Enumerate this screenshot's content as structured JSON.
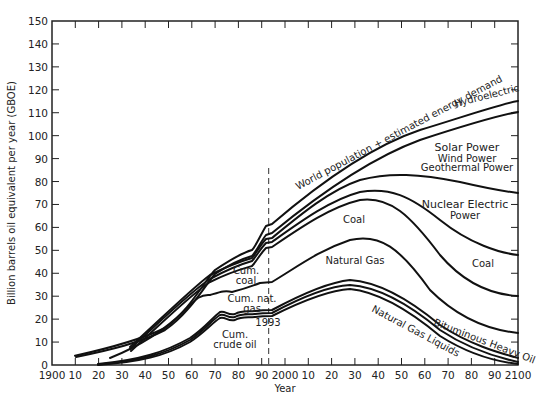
{
  "chart_data": {
    "type": "area",
    "title": "",
    "xlabel": "Year",
    "ylabel": "Billion barrels oil equivalent per year (GBOE)",
    "xlim": [
      1900,
      2100
    ],
    "ylim": [
      0,
      150
    ],
    "grid": false,
    "x_tick_labels": [
      "1900",
      "10",
      "20",
      "30",
      "40",
      "50",
      "60",
      "70",
      "80",
      "90",
      "2000",
      "10",
      "20",
      "30",
      "40",
      "50",
      "60",
      "70",
      "80",
      "90",
      "2100"
    ],
    "y_tick_labels": [
      "0",
      "10",
      "20",
      "30",
      "40",
      "50",
      "60",
      "70",
      "80",
      "90",
      "100",
      "110",
      "120",
      "130",
      "140",
      "150"
    ],
    "marker_line": {
      "year": 1993,
      "label": "1993",
      "style": "dashed"
    },
    "series": [
      {
        "name": "World population + estimated energy demand",
        "x": [
          1910,
          1930,
          1950,
          1960,
          1970,
          1980,
          1988,
          1993,
          2000,
          2020,
          2040,
          2060,
          2080,
          2100
        ],
        "values": [
          4,
          8,
          16,
          28,
          42,
          49,
          55,
          61,
          67,
          84,
          97,
          106,
          112,
          115
        ]
      },
      {
        "name": "Hydroelectric",
        "x": [
          1910,
          1930,
          1950,
          1960,
          1970,
          1980,
          1988,
          1993,
          2000,
          2020,
          2040,
          2060,
          2080,
          2100
        ],
        "values": [
          3.5,
          7,
          15,
          26,
          40,
          46,
          52,
          57,
          63,
          80,
          92,
          100,
          106,
          110
        ]
      },
      {
        "name": "Solar Power / Wind Power / Geothermal Power",
        "x": [
          1950,
          1960,
          1970,
          1980,
          1988,
          1993,
          2000,
          2020,
          2040,
          2060,
          2080,
          2100
        ],
        "values": [
          14,
          25,
          38,
          44,
          50,
          54,
          60,
          76,
          83,
          81,
          78,
          75
        ]
      },
      {
        "name": "Nuclear Electric Power",
        "x": [
          1950,
          1960,
          1970,
          1980,
          1988,
          1993,
          2000,
          2020,
          2030,
          2050,
          2070,
          2090,
          2100
        ],
        "values": [
          14,
          25,
          38,
          44,
          50,
          54,
          59,
          73,
          77,
          70,
          58,
          50,
          48
        ]
      },
      {
        "name": "Coal",
        "x": [
          1950,
          1960,
          1970,
          1980,
          1988,
          1993,
          2000,
          2020,
          2030,
          2050,
          2070,
          2090,
          2100
        ],
        "values": [
          14,
          25,
          38,
          44,
          50,
          54,
          57,
          70,
          73,
          63,
          46,
          34,
          31
        ]
      },
      {
        "name": "Natural Gas",
        "x": [
          1950,
          1960,
          1970,
          1975,
          1980,
          1985,
          1993,
          2000,
          2010,
          2020,
          2030,
          2050,
          2070,
          2090,
          2100
        ],
        "values": [
          8,
          16,
          27,
          31,
          30,
          33,
          36,
          40,
          50,
          55,
          56,
          45,
          28,
          16,
          14
        ]
      },
      {
        "name": "Bituminous Heavy Oil",
        "x": [
          1920,
          1940,
          1950,
          1960,
          1970,
          1975,
          1980,
          1985,
          1993,
          2000,
          2020,
          2040,
          2060,
          2080,
          2100
        ],
        "values": [
          0.5,
          2,
          4,
          10,
          19,
          23,
          21,
          23,
          24,
          29,
          37,
          31,
          18,
          8,
          3
        ]
      },
      {
        "name": "Natural Gas Liquids",
        "x": [
          1920,
          1940,
          1950,
          1960,
          1970,
          1975,
          1980,
          1985,
          1993,
          2000,
          2020,
          2040,
          2060,
          2080,
          2100
        ],
        "values": [
          0.5,
          2,
          4,
          9,
          18,
          22,
          20,
          22,
          23,
          28,
          35,
          29,
          16,
          6,
          1.5
        ]
      },
      {
        "name": "Crude oil",
        "x": [
          1920,
          1940,
          1950,
          1960,
          1970,
          1975,
          1980,
          1985,
          1993,
          2000,
          2020,
          2040,
          2060,
          2080,
          2100
        ],
        "values": [
          0.3,
          1.5,
          3.5,
          8.5,
          17,
          21,
          19,
          21,
          22,
          27,
          33,
          27,
          14,
          5,
          0.5
        ]
      }
    ],
    "annotations": [
      "World population + estimated energy demand",
      "Hydroelectric",
      "Solar Power",
      "Wind Power",
      "Geothermal Power",
      "Nuclear Electric",
      "Power",
      "Coal",
      "Natural Gas",
      "Coal",
      "Cum. coal",
      "Cum. nat. gas",
      "Cum. crude oil",
      "1993",
      "Natural Gas Liquids",
      "Bituminous Heavy Oil"
    ]
  },
  "labels": {
    "demand": "World population + estimated energy demand",
    "hydro": "Hydroelectric",
    "solar": "Solar Power",
    "wind": "Wind Power",
    "geo": "Geothermal Power",
    "nuclear1": "Nuclear Electric",
    "nuclear2": "Power",
    "coal_mid": "Coal",
    "natgas": "Natural Gas",
    "coal_right": "Coal",
    "cum_coal1": "Cum.",
    "cum_coal2": "coal",
    "cum_gas1": "Cum. nat.",
    "cum_gas2": "gas",
    "cum_oil1": "Cum.",
    "cum_oil2": "crude oil",
    "year_marker": "1993",
    "ngl": "Natural Gas Liquids",
    "heavy_oil": "Bituminous Heavy Oil",
    "xlabel": "Year",
    "ylabel": "Billion barrels oil equivalent per year (GBOE)"
  },
  "xticks": [
    "1900",
    "10",
    "20",
    "30",
    "40",
    "50",
    "60",
    "70",
    "80",
    "90",
    "2000",
    "10",
    "20",
    "30",
    "40",
    "50",
    "60",
    "70",
    "80",
    "90",
    "2100"
  ],
  "yticks": [
    "0",
    "10",
    "20",
    "30",
    "40",
    "50",
    "60",
    "70",
    "80",
    "90",
    "100",
    "110",
    "120",
    "130",
    "140",
    "150"
  ]
}
